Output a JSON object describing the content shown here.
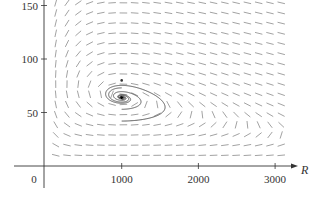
{
  "chart_data": {
    "type": "line",
    "subtype": "phase-portrait-direction-field",
    "title": "",
    "xlabel": "R",
    "ylabel": "",
    "xlim": [
      0,
      3200
    ],
    "ylim": [
      0,
      155
    ],
    "x_ticks": [
      {
        "value": 0,
        "label": "0"
      },
      {
        "value": 1000,
        "label": "1000"
      },
      {
        "value": 2000,
        "label": "2000"
      },
      {
        "value": 3000,
        "label": "3000"
      }
    ],
    "y_ticks": [
      {
        "value": 50,
        "label": "50"
      },
      {
        "value": 100,
        "label": "100"
      },
      {
        "value": 150,
        "label": "150"
      }
    ],
    "origin_label": "0",
    "grid": false,
    "equilibrium_point": {
      "R": 1000,
      "W": 80
    },
    "series": [
      {
        "name": "orbit-1 (innermost)",
        "R_range": [
          750,
          1300
        ],
        "W_range": [
          73,
          92
        ]
      },
      {
        "name": "orbit-2",
        "R_range": [
          540,
          1720
        ],
        "W_range": [
          62,
          106
        ]
      },
      {
        "name": "orbit-3",
        "R_range": [
          300,
          2120
        ],
        "W_range": [
          53,
          122
        ]
      },
      {
        "name": "orbit-4 (outermost)",
        "R_range": [
          170,
          2810
        ],
        "W_range": [
          42,
          142
        ]
      }
    ],
    "direction_field": {
      "R_start": 140,
      "R_step": 147,
      "R_count": 21,
      "W_start": 10,
      "W_step": 9.5,
      "W_count": 16
    },
    "colors": {
      "axis": "#333333",
      "orbit": "#555555",
      "field": "#8a8a8a"
    }
  }
}
